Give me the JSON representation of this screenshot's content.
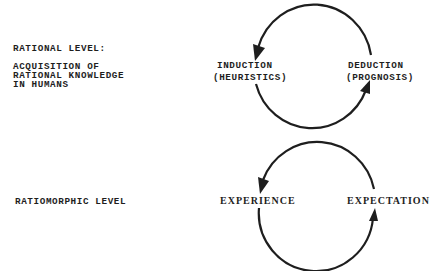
{
  "rational": {
    "title": "RATIONAL LEVEL:",
    "description_lines": [
      "ACQUISITION OF",
      "RATIONAL KNOWLEDGE",
      "IN HUMANS"
    ],
    "cycle": {
      "left_node": {
        "line1": "INDUCTION",
        "line2": "(HEURISTICS)"
      },
      "right_node": {
        "line1": "DEDUCTION",
        "line2": "(PROGNOSIS)"
      },
      "direction": "counterclockwise"
    }
  },
  "ratiomorphic": {
    "title": "RATIOMORPHIC LEVEL",
    "cycle": {
      "left_node": {
        "line1": "EXPERIENCE"
      },
      "right_node": {
        "line1": "EXPECTATION"
      },
      "direction": "counterclockwise"
    }
  },
  "colors": {
    "ink": "#1e1e1e",
    "background": "#ffffff"
  }
}
